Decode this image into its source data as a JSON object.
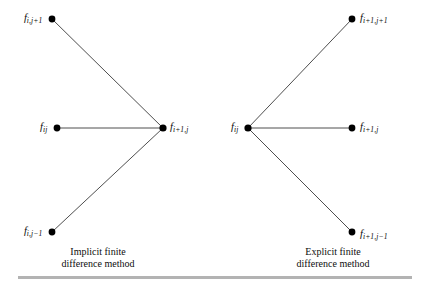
{
  "figure": {
    "background_color": "#ffffff",
    "line_color": "#3a3a3a",
    "node_color": "#000000",
    "rule_color": "#b3b3b3"
  },
  "panels": [
    {
      "id": "implicit",
      "caption_line1": "Implicit finite",
      "caption_line2": "difference method",
      "center_node": "f_{i+1,j}",
      "nodes": [
        {
          "id": "f-i-jp1",
          "base": "f",
          "sub_html": "i,j+1",
          "sub_plain": "i,j+1",
          "x": 52,
          "y": 19,
          "label_side": "left"
        },
        {
          "id": "f-ij",
          "base": "f",
          "sub_html": "ij",
          "sub_plain": "ij",
          "x": 57,
          "y": 128,
          "label_side": "left"
        },
        {
          "id": "f-i-jm1",
          "base": "f",
          "sub_html": "i,j-1",
          "sub_plain": "i,j−1",
          "x": 52,
          "y": 232,
          "label_side": "left"
        },
        {
          "id": "f-ip1-j",
          "base": "f",
          "sub_html": "i+1,j",
          "sub_plain": "i+1,j",
          "x": 163,
          "y": 128,
          "label_side": "right"
        }
      ],
      "edges": [
        {
          "from": "f-i-jp1",
          "to": "f-ip1-j"
        },
        {
          "from": "f-ij",
          "to": "f-ip1-j"
        },
        {
          "from": "f-i-jm1",
          "to": "f-ip1-j"
        }
      ]
    },
    {
      "id": "explicit",
      "caption_line1": "Explicit finite",
      "caption_line2": "difference method",
      "center_node": "f_{ij}",
      "nodes": [
        {
          "id": "f-ip1-jp1",
          "base": "f",
          "sub_html": "i+1,j+1",
          "sub_plain": "i+1,j+1",
          "x": 352,
          "y": 19,
          "label_side": "right"
        },
        {
          "id": "f-ij-r",
          "base": "f",
          "sub_html": "ij",
          "sub_plain": "ij",
          "x": 248,
          "y": 128,
          "label_side": "left"
        },
        {
          "id": "f-ip1-j-r",
          "base": "f",
          "sub_html": "i+1,j",
          "sub_plain": "i+1,j",
          "x": 352,
          "y": 128,
          "label_side": "right"
        },
        {
          "id": "f-ip1-jm1",
          "base": "f",
          "sub_html": "i+1,j-1",
          "sub_plain": "i+1,j−1",
          "x": 352,
          "y": 232,
          "label_side": "right"
        }
      ],
      "edges": [
        {
          "from": "f-ij-r",
          "to": "f-ip1-jp1"
        },
        {
          "from": "f-ij-r",
          "to": "f-ip1-j-r"
        },
        {
          "from": "f-ij-r",
          "to": "f-ip1-jm1"
        }
      ]
    }
  ],
  "labels": {
    "left_top": {
      "base": "f",
      "sub": "i,j+1"
    },
    "left_mid": {
      "base": "f",
      "sub": "ij"
    },
    "left_bottom": {
      "base": "f",
      "sub": "i,j−1"
    },
    "left_vertex": {
      "base": "f",
      "sub": "i+1,j"
    },
    "right_top": {
      "base": "f",
      "sub": "i+1,j+1"
    },
    "right_vertex": {
      "base": "f",
      "sub": "ij"
    },
    "right_mid": {
      "base": "f",
      "sub": "i+1,j"
    },
    "right_bottom": {
      "base": "f",
      "sub": "i+1,j−1"
    }
  },
  "captions": {
    "implicit": {
      "line1": "Implicit finite",
      "line2": "difference method"
    },
    "explicit": {
      "line1": "Explicit finite",
      "line2": "difference method"
    }
  }
}
